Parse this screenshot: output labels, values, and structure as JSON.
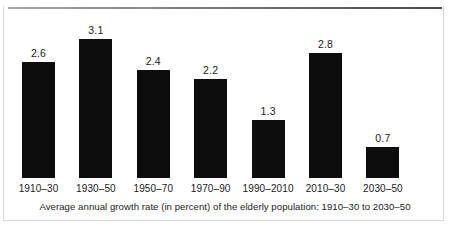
{
  "chart_data": {
    "type": "bar",
    "title": "",
    "caption": "Average annual growth rate (in percent) of the elderly population: 1910–30 to 2030–50",
    "categories": [
      "1910–30",
      "1930–50",
      "1950–70",
      "1970–90",
      "1990–2010",
      "2010–30",
      "2030–50"
    ],
    "values": [
      2.6,
      3.1,
      2.4,
      2.2,
      1.3,
      2.8,
      0.7
    ],
    "value_labels": [
      "2.6",
      "3.1",
      "2.4",
      "2.2",
      "1.3",
      "2.8",
      "0.7"
    ],
    "xlabel": "",
    "ylabel": "",
    "ylim": [
      0,
      3.4
    ],
    "grid": false,
    "legend": false,
    "bar_color": "#0d0d0d",
    "background_color": "#ffffff",
    "rule_color": "#6f6f6f",
    "border_color": "#d8d8d8"
  }
}
